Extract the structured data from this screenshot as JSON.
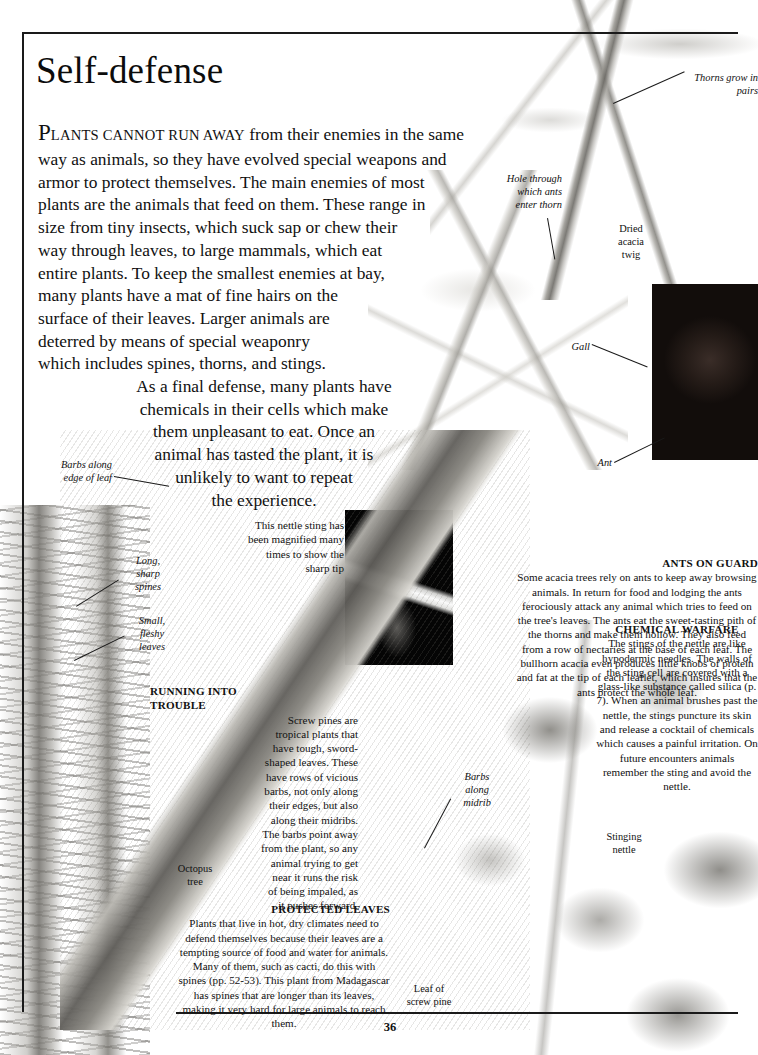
{
  "page": {
    "title": "Self-defense",
    "number": "36"
  },
  "intro": {
    "lines": [
      "PLANTS CANNOT RUN AWAY from their enemies in the same",
      "way as animals, so they have evolved special weapons and",
      "armor to protect themselves. The main enemies of most",
      "plants are the animals that feed on them. These range in",
      "size from tiny insects, which suck sap or chew their",
      "way through leaves, to large mammals, which eat",
      "entire plants. To keep the smallest enemies at bay,",
      "many plants have a mat of fine hairs on the",
      "surface of their leaves. Larger animals are",
      "deterred by means of special weaponry",
      "which includes spines, thorns, and stings.",
      "As a final defense, many plants have",
      "chemicals in their cells which make",
      "them unpleasant to eat. Once an",
      "animal has tasted the plant, it is",
      "unlikely to want to repeat",
      "the experience."
    ],
    "dropcap": "P",
    "smallcaps": "LANTS CANNOT RUN AWAY",
    "first_line_rest": " from their enemies in the same"
  },
  "callouts": {
    "ants_on_guard": {
      "heading": "ANTS ON GUARD",
      "body": "Some acacia trees rely on ants to keep away browsing animals. In return for food and lodging the ants ferociously attack any animal which tries to feed on the tree's leaves. The ants eat the sweet-tasting pith of the thorns and make them hollow. They also feed from a row of nectaries at the base of each leaf. The bullhorn acacia even produces little knobs of protein and fat at the tip of each leaflet, which insures that the ants protect the whole leaf."
    },
    "chemical_warfare": {
      "heading": "CHEMICAL WARFARE",
      "body": "The stings of the nettle are like hypodermic needles. The walls of the sting cell are covered with a glass-like substance called silica (p. 7). When an animal brushes past the nettle, the stings puncture its skin and release a cocktail of chemicals which causes a painful irritation. On future encounters animals remember the sting and avoid the nettle."
    },
    "running_into_trouble": {
      "heading_line1": "RUNNING INTO",
      "heading_line2": "TROUBLE",
      "lines": [
        "Screw pines are",
        "tropical plants that",
        "have tough, sword-",
        "shaped leaves. These",
        "have rows of vicious",
        "barbs, not only along",
        "their edges, but also",
        "along their midribs.",
        "The barbs point away",
        "from the plant, so any",
        "animal trying to get",
        "near it runs the risk",
        "of being impaled, as",
        "it pushes forward."
      ]
    },
    "protected_leaves": {
      "heading": "PROTECTED LEAVES",
      "body": "Plants that live in hot, dry climates need to defend themselves because their leaves are a tempting source of food and water for animals. Many of them, such as cacti, do this with spines (pp. 52-53). This plant from Madagascar has spines that are longer than its leaves, making it very hard for large animals to reach them."
    },
    "sting_caption": "This nettle sting has been magnified many times to show the sharp tip"
  },
  "labels": {
    "thorns_grow_in_pairs": "Thorns grow in pairs",
    "hole_through_which_ants_enter_thorn": "Hole through which ants enter thorn",
    "dried_acacia_twig": "Dried acacia twig",
    "gall": "Gall",
    "ant": "Ant",
    "barbs_along_edge_of_leaf": "Barbs along edge of leaf",
    "long_sharp_spines": "Long, sharp spines",
    "small_fleshy_leaves": "Small, fleshy leaves",
    "octopus_tree": "Octopus tree",
    "barbs_along_midrib": "Barbs along midrib",
    "stinging_nettle": "Stinging nettle",
    "leaf_of_screw_pine": "Leaf of screw pine"
  },
  "colors": {
    "ink": "#111111",
    "rule": "#1a1a1a",
    "paper": "#ffffff"
  }
}
